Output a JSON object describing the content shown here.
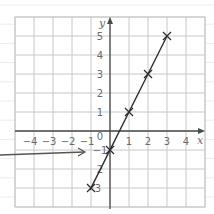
{
  "chart_data": {
    "type": "line",
    "title": "",
    "xlabel": "x",
    "ylabel": "y",
    "equation_implied": "y = 2x - 1",
    "xlim": [
      -5,
      5
    ],
    "ylim": [
      -4,
      6
    ],
    "grid": true,
    "x_tick_labels": [
      "-4",
      "-3",
      "-2",
      "-1",
      "1",
      "2",
      "3",
      "4"
    ],
    "y_tick_labels": [
      "5",
      "4",
      "3",
      "2",
      "1",
      "-1",
      "2",
      "3"
    ],
    "origin_label": "0",
    "series": [
      {
        "name": "line",
        "marker": "x",
        "points": [
          {
            "x": -1,
            "y": -3
          },
          {
            "x": 0,
            "y": -1
          },
          {
            "x": 1,
            "y": 1
          },
          {
            "x": 2,
            "y": 3
          },
          {
            "x": 3,
            "y": 5
          }
        ]
      }
    ],
    "annotations": [
      {
        "type": "arrow",
        "from": "left margin",
        "points_to": "y-intercept label -1"
      }
    ]
  },
  "colors": {
    "grid": "#c8c8c8",
    "axis": "#4a4a4a",
    "line": "#2e2e2e",
    "label": "#6b6b6b",
    "paper_lines": "#ececec"
  }
}
